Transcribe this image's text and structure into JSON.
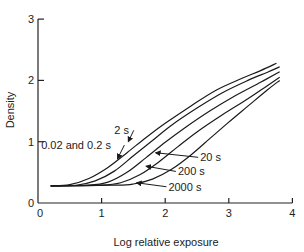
{
  "chart_data": {
    "type": "line",
    "title": "",
    "xlabel": "Log relative exposure",
    "ylabel": "Density",
    "xlim": [
      0,
      4
    ],
    "ylim": [
      0,
      3
    ],
    "xticks": [
      0,
      1,
      2,
      3,
      4
    ],
    "yticks": [
      0,
      1,
      2,
      3
    ],
    "grid": false,
    "legend": "inline annotations with arrows",
    "series": [
      {
        "name": "0.02 and 0.2 s",
        "points": [
          [
            0.2,
            0.28
          ],
          [
            0.5,
            0.3
          ],
          [
            0.8,
            0.4
          ],
          [
            1.1,
            0.58
          ],
          [
            1.4,
            0.82
          ],
          [
            1.7,
            1.07
          ],
          [
            2.0,
            1.3
          ],
          [
            2.4,
            1.58
          ],
          [
            2.8,
            1.84
          ],
          [
            3.2,
            2.03
          ],
          [
            3.5,
            2.16
          ],
          [
            3.75,
            2.28
          ]
        ]
      },
      {
        "name": "2 s",
        "points": [
          [
            0.2,
            0.28
          ],
          [
            0.6,
            0.29
          ],
          [
            0.9,
            0.36
          ],
          [
            1.2,
            0.52
          ],
          [
            1.5,
            0.77
          ],
          [
            1.8,
            1.02
          ],
          [
            2.1,
            1.27
          ],
          [
            2.5,
            1.55
          ],
          [
            2.9,
            1.8
          ],
          [
            3.3,
            2.0
          ],
          [
            3.6,
            2.13
          ],
          [
            3.8,
            2.22
          ]
        ]
      },
      {
        "name": "20 s",
        "points": [
          [
            0.2,
            0.28
          ],
          [
            0.8,
            0.29
          ],
          [
            1.1,
            0.34
          ],
          [
            1.4,
            0.5
          ],
          [
            1.7,
            0.74
          ],
          [
            2.0,
            0.99
          ],
          [
            2.3,
            1.22
          ],
          [
            2.7,
            1.5
          ],
          [
            3.1,
            1.75
          ],
          [
            3.5,
            1.97
          ],
          [
            3.8,
            2.14
          ]
        ]
      },
      {
        "name": "200 s",
        "points": [
          [
            0.2,
            0.28
          ],
          [
            1.0,
            0.29
          ],
          [
            1.3,
            0.33
          ],
          [
            1.6,
            0.46
          ],
          [
            1.9,
            0.67
          ],
          [
            2.2,
            0.92
          ],
          [
            2.5,
            1.16
          ],
          [
            2.9,
            1.44
          ],
          [
            3.3,
            1.7
          ],
          [
            3.6,
            1.91
          ],
          [
            3.8,
            2.05
          ]
        ]
      },
      {
        "name": "2000 s",
        "points": [
          [
            0.2,
            0.28
          ],
          [
            1.2,
            0.29
          ],
          [
            1.5,
            0.31
          ],
          [
            1.8,
            0.39
          ],
          [
            2.1,
            0.55
          ],
          [
            2.4,
            0.78
          ],
          [
            2.7,
            1.05
          ],
          [
            3.0,
            1.32
          ],
          [
            3.3,
            1.58
          ],
          [
            3.6,
            1.84
          ],
          [
            3.8,
            2.0
          ]
        ]
      }
    ],
    "annotations": [
      {
        "text": "2 s",
        "x": 1.2,
        "y": 1.12,
        "arrow_to": [
          1.42,
          1.0
        ]
      },
      {
        "text": "0.02 and 0.2 s",
        "x": 0.05,
        "y": 0.88,
        "arrow_to": [
          1.25,
          0.72
        ]
      },
      {
        "text": "20 s",
        "x": 2.55,
        "y": 0.68,
        "arrow_to": [
          1.85,
          0.82
        ]
      },
      {
        "text": "200 s",
        "x": 2.2,
        "y": 0.45,
        "arrow_to": [
          1.7,
          0.6
        ]
      },
      {
        "text": "2000 s",
        "x": 2.05,
        "y": 0.2,
        "arrow_to": [
          1.55,
          0.33
        ]
      }
    ]
  }
}
